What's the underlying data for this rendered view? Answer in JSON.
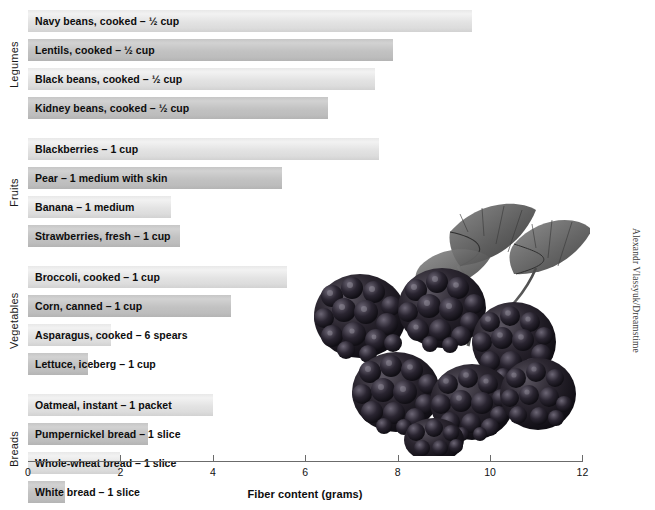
{
  "credit": "Alexandr Vlassyuk/Dreamstime",
  "photo": {
    "alt_name": "blackberries-photo"
  },
  "chart_data": {
    "type": "bar",
    "orientation": "horizontal",
    "title": "",
    "xlabel": "Fiber content (grams)",
    "ylabel": "",
    "xlim": [
      0,
      12
    ],
    "xticks": [
      0,
      2,
      4,
      6,
      8,
      10,
      12
    ],
    "xtick_labels": [
      "0",
      "2",
      "4",
      "6",
      "8",
      "10",
      "12"
    ],
    "grid": false,
    "legend": false,
    "groups": [
      {
        "name": "Legumes",
        "items": [
          {
            "label": "Navy beans, cooked – ½ cup",
            "value": 9.6,
            "shade": "light"
          },
          {
            "label": "Lentils, cooked – ½ cup",
            "value": 7.9,
            "shade": "dark"
          },
          {
            "label": "Black beans, cooked – ½ cup",
            "value": 7.5,
            "shade": "light"
          },
          {
            "label": "Kidney beans, cooked – ½ cup",
            "value": 6.5,
            "shade": "dark"
          }
        ]
      },
      {
        "name": "Fruits",
        "items": [
          {
            "label": "Blackberries – 1 cup",
            "value": 7.6,
            "shade": "light"
          },
          {
            "label": "Pear – 1 medium with skin",
            "value": 5.5,
            "shade": "dark"
          },
          {
            "label": "Banana – 1 medium",
            "value": 3.1,
            "shade": "light"
          },
          {
            "label": "Strawberries, fresh – 1 cup",
            "value": 3.3,
            "shade": "dark"
          }
        ]
      },
      {
        "name": "Vegetables",
        "items": [
          {
            "label": "Broccoli, cooked – 1 cup",
            "value": 5.6,
            "shade": "light"
          },
          {
            "label": "Corn, canned – 1 cup",
            "value": 4.4,
            "shade": "dark"
          },
          {
            "label": "Asparagus, cooked – 6 spears",
            "value": 1.8,
            "shade": "light"
          },
          {
            "label": "Lettuce, iceberg – 1 cup",
            "value": 1.3,
            "shade": "dark"
          }
        ]
      },
      {
        "name": "Breads",
        "items": [
          {
            "label": "Oatmeal, instant – 1 packet",
            "value": 4.0,
            "shade": "light"
          },
          {
            "label": "Pumpernickel bread – 1 slice",
            "value": 2.6,
            "shade": "dark"
          },
          {
            "label": "Whole-wheat bread – 1 slice",
            "value": 2.0,
            "shade": "light"
          },
          {
            "label": "White bread – 1 slice",
            "value": 0.8,
            "shade": "dark"
          }
        ]
      }
    ]
  },
  "layout": {
    "x0_px": 28,
    "px_per_unit": 46.2,
    "row_height": 22,
    "row_gap": 7,
    "group_gap": 12,
    "first_row_top": 10,
    "min_label_width": 140
  }
}
